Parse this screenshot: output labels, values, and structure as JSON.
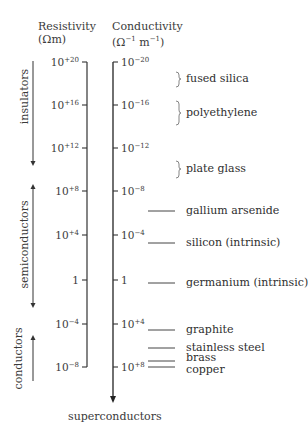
{
  "headers": {
    "resistivity_title": "Resistivity",
    "resistivity_unit": "(Ωm)",
    "conductivity_title": "Conductivity",
    "conductivity_unit_base": "(Ω",
    "conductivity_unit_exp1": "−1",
    "conductivity_unit_mid": " m",
    "conductivity_unit_exp2": "−1",
    "conductivity_unit_end": ")"
  },
  "resistivity_ticks": [
    {
      "base": "10",
      "exp": "+20",
      "y": 62
    },
    {
      "base": "10",
      "exp": "+16",
      "y": 105
    },
    {
      "base": "10",
      "exp": "+12",
      "y": 148
    },
    {
      "base": "10",
      "exp": "+8",
      "y": 191
    },
    {
      "base": "10",
      "exp": "+4",
      "y": 235
    },
    {
      "base": "1",
      "exp": "",
      "y": 280
    },
    {
      "base": "10",
      "exp": "−4",
      "y": 324
    },
    {
      "base": "10",
      "exp": "−8",
      "y": 367
    }
  ],
  "conductivity_ticks": [
    {
      "base": "10",
      "exp": "−20",
      "y": 62
    },
    {
      "base": "10",
      "exp": "−16",
      "y": 105
    },
    {
      "base": "10",
      "exp": "−12",
      "y": 148
    },
    {
      "base": "10",
      "exp": "−8",
      "y": 191
    },
    {
      "base": "10",
      "exp": "−4",
      "y": 235
    },
    {
      "base": "1",
      "exp": "",
      "y": 280
    },
    {
      "base": "10",
      "exp": "+4",
      "y": 324
    },
    {
      "base": "10",
      "exp": "+8",
      "y": 367
    }
  ],
  "categories": {
    "insulators": "insulators",
    "semiconductors": "semiconductors",
    "conductors": "conductors"
  },
  "materials": [
    {
      "label": "fused silica",
      "marker": "bracket",
      "y": 79
    },
    {
      "label": "polyethylene",
      "marker": "bracket",
      "y": 113
    },
    {
      "label": "plate glass",
      "marker": "bracket",
      "y": 169
    },
    {
      "label": "gallium arsenide",
      "marker": "line",
      "y": 211
    },
    {
      "label": "silicon (intrinsic)",
      "marker": "line",
      "y": 243
    },
    {
      "label": "germanium (intrinsic)",
      "marker": "line",
      "y": 283
    },
    {
      "label": "graphite",
      "marker": "line",
      "y": 330
    },
    {
      "label": "stainless steel",
      "marker": "line",
      "y": 348
    },
    {
      "label": "brass",
      "marker": "line",
      "y": 361
    },
    {
      "label": "copper",
      "marker": "line",
      "y": 367
    }
  ],
  "bottom_label": "superconductors"
}
